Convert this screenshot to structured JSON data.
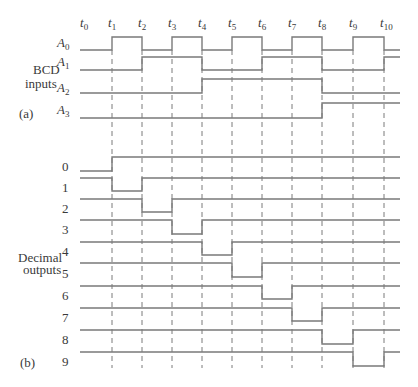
{
  "figure": {
    "part_a_label": "(a)",
    "part_b_label": "(b)",
    "bcd_group_label_line1": "BCD",
    "bcd_group_label_line2": "inputs",
    "decimal_group_label_line1": "Decimal",
    "decimal_group_label_line2": "outputs",
    "line_color": "#7a7a7a",
    "text_color": "#3a3a3a"
  },
  "time_marks": [
    {
      "label": "t",
      "sub": "0",
      "x": 84
    },
    {
      "label": "t",
      "sub": "1",
      "x": 112
    },
    {
      "label": "t",
      "sub": "2",
      "x": 142
    },
    {
      "label": "t",
      "sub": "3",
      "x": 172
    },
    {
      "label": "t",
      "sub": "4",
      "x": 202
    },
    {
      "label": "t",
      "sub": "5",
      "x": 232
    },
    {
      "label": "t",
      "sub": "6",
      "x": 262
    },
    {
      "label": "t",
      "sub": "7",
      "x": 292
    },
    {
      "label": "t",
      "sub": "8",
      "x": 322
    },
    {
      "label": "t",
      "sub": "9",
      "x": 353
    },
    {
      "label": "t",
      "sub": "10",
      "x": 384
    }
  ],
  "layout": {
    "x_start": 80,
    "x_end": 400,
    "dash_top": 50,
    "dash_bottom": 368
  },
  "inputs": [
    {
      "name": "A",
      "sub": "0",
      "high_y": 37,
      "low_y": 50,
      "label_y": 47,
      "levels": [
        0,
        1,
        0,
        1,
        0,
        1,
        0,
        1,
        0,
        1,
        0
      ]
    },
    {
      "name": "A",
      "sub": "1",
      "high_y": 57,
      "low_y": 70,
      "label_y": 66,
      "levels": [
        0,
        0,
        1,
        1,
        0,
        0,
        1,
        1,
        0,
        0,
        1
      ]
    },
    {
      "name": "A",
      "sub": "2",
      "high_y": 79,
      "low_y": 93,
      "label_y": 92,
      "levels": [
        0,
        0,
        0,
        0,
        1,
        1,
        1,
        1,
        0,
        0,
        0
      ]
    },
    {
      "name": "A",
      "sub": "3",
      "high_y": 103,
      "low_y": 118,
      "label_y": 114,
      "levels": [
        0,
        0,
        0,
        0,
        0,
        0,
        0,
        0,
        1,
        1,
        1
      ]
    }
  ],
  "outputs": [
    {
      "label": "0",
      "high_y": 157,
      "low_y": 171,
      "label_y": 171,
      "active_interval": 0
    },
    {
      "label": "1",
      "high_y": 178,
      "low_y": 191,
      "label_y": 192,
      "active_interval": 1
    },
    {
      "label": "2",
      "high_y": 199,
      "low_y": 212,
      "label_y": 213,
      "active_interval": 2
    },
    {
      "label": "3",
      "high_y": 220,
      "low_y": 234,
      "label_y": 234,
      "active_interval": 3
    },
    {
      "label": "4",
      "high_y": 242,
      "low_y": 255,
      "label_y": 256,
      "active_interval": 4
    },
    {
      "label": "5",
      "high_y": 263,
      "low_y": 277,
      "label_y": 278,
      "active_interval": 5
    },
    {
      "label": "6",
      "high_y": 286,
      "low_y": 299,
      "label_y": 300,
      "active_interval": 6
    },
    {
      "label": "7",
      "high_y": 308,
      "low_y": 321,
      "label_y": 322,
      "active_interval": 7
    },
    {
      "label": "8",
      "high_y": 330,
      "low_y": 344,
      "label_y": 344,
      "active_interval": 8
    },
    {
      "label": "9",
      "high_y": 352,
      "low_y": 366,
      "label_y": 366,
      "active_interval": 9
    }
  ]
}
